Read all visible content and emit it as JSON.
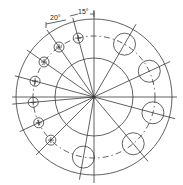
{
  "drawing": {
    "title": "Bolt circle flange layout",
    "dimension_labels": [
      {
        "id": "angle-20",
        "text": "20°"
      },
      {
        "id": "angle-15",
        "text": "15°"
      }
    ],
    "small_hole_spacing_deg": 20,
    "large_hole_offset_deg": 15,
    "small_hole_count": 7,
    "large_hole_count": 5
  }
}
